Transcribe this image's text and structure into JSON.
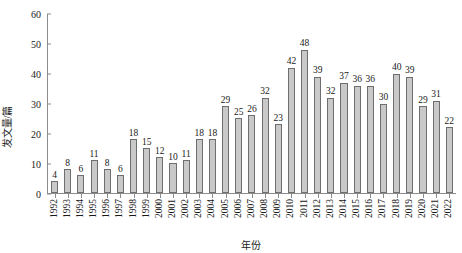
{
  "chart_data": {
    "type": "bar",
    "title": "",
    "xlabel": "年份",
    "ylabel": "发文量/篇",
    "ylim": [
      0,
      60
    ],
    "yticks": [
      0,
      10,
      20,
      30,
      40,
      50,
      60
    ],
    "grid": false,
    "legend": null,
    "bar_color": "#c9c9c9",
    "bar_border_color": "#6e6e6e",
    "axis_color": "#8c8c8c",
    "show_value_labels": true,
    "categories": [
      "1992",
      "1993",
      "1994",
      "1995",
      "1996",
      "1997",
      "1998",
      "1999",
      "2000",
      "2001",
      "2002",
      "2003",
      "2004",
      "2005",
      "2006",
      "2007",
      "2008",
      "2009",
      "2010",
      "2011",
      "2012",
      "2013",
      "2014",
      "2015",
      "2016",
      "2017",
      "2018",
      "2019",
      "2020",
      "2021",
      "2022"
    ],
    "values": [
      4,
      8,
      6,
      11,
      8,
      6,
      18,
      15,
      12,
      10,
      11,
      18,
      18,
      29,
      25,
      26,
      32,
      23,
      42,
      48,
      39,
      32,
      37,
      36,
      36,
      30,
      40,
      39,
      29,
      31,
      22
    ]
  }
}
